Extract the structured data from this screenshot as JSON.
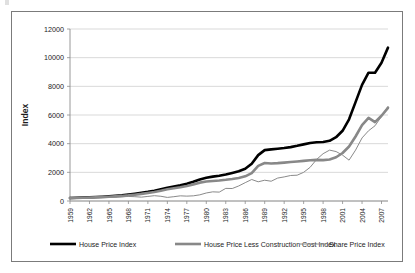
{
  "figure": {
    "background_color": "#ffffff",
    "border_color": "#7b7b7b"
  },
  "chart_data": {
    "type": "line",
    "title": "",
    "xlabel": "",
    "ylabel": "Index",
    "xlim": [
      1959,
      2008
    ],
    "ylim": [
      0,
      12000
    ],
    "grid": true,
    "grid_axis": "y",
    "legend_position": "bottom",
    "ytick_labels": [
      "0",
      "2000",
      "4000",
      "6000",
      "8000",
      "10000",
      "12000"
    ],
    "yticks": [
      0,
      2000,
      4000,
      6000,
      8000,
      10000,
      12000
    ],
    "xtick_labels": [
      "1959",
      "1962",
      "1965",
      "1968",
      "1971",
      "1974",
      "1977",
      "1980",
      "1983",
      "1986",
      "1989",
      "1992",
      "1995",
      "1998",
      "2001",
      "2004",
      "2007"
    ],
    "xticks": [
      1959,
      1962,
      1965,
      1968,
      1971,
      1974,
      1977,
      1980,
      1983,
      1986,
      1989,
      1992,
      1995,
      1998,
      2001,
      2004,
      2007
    ],
    "x": [
      1959,
      1960,
      1961,
      1962,
      1963,
      1964,
      1965,
      1966,
      1967,
      1968,
      1969,
      1970,
      1971,
      1972,
      1973,
      1974,
      1975,
      1976,
      1977,
      1978,
      1979,
      1980,
      1981,
      1982,
      1983,
      1984,
      1985,
      1986,
      1987,
      1988,
      1989,
      1990,
      1991,
      1992,
      1993,
      1994,
      1995,
      1996,
      1997,
      1998,
      1999,
      2000,
      2001,
      2002,
      2003,
      2004,
      2005,
      2006,
      2007,
      2008
    ],
    "series": [
      {
        "name": "House Price Index",
        "color": "#000000",
        "line_width": 2.6,
        "values": [
          210,
          225,
          240,
          255,
          275,
          300,
          330,
          360,
          400,
          450,
          510,
          570,
          640,
          720,
          820,
          930,
          1010,
          1090,
          1200,
          1340,
          1500,
          1620,
          1700,
          1760,
          1850,
          1960,
          2080,
          2250,
          2600,
          3200,
          3550,
          3600,
          3650,
          3700,
          3760,
          3850,
          3950,
          4050,
          4100,
          4120,
          4200,
          4450,
          4900,
          5700,
          6900,
          8100,
          8950,
          8950,
          9650,
          10700
        ]
      },
      {
        "name": "House Price Less Construction Cost Index",
        "color": "#888888",
        "line_width": 2.6,
        "values": [
          200,
          210,
          222,
          236,
          252,
          272,
          295,
          320,
          350,
          390,
          440,
          495,
          560,
          630,
          720,
          820,
          890,
          960,
          1050,
          1160,
          1280,
          1360,
          1400,
          1430,
          1480,
          1540,
          1610,
          1720,
          1950,
          2450,
          2650,
          2620,
          2640,
          2680,
          2720,
          2760,
          2800,
          2840,
          2870,
          2850,
          2900,
          3050,
          3350,
          3800,
          4500,
          5300,
          5800,
          5500,
          5950,
          6500
        ]
      },
      {
        "name": "Share Price Index",
        "color": "#8a8a8a",
        "line_width": 1.0,
        "values": [
          200,
          215,
          230,
          215,
          240,
          265,
          280,
          265,
          290,
          320,
          300,
          270,
          320,
          370,
          330,
          250,
          300,
          360,
          340,
          360,
          430,
          560,
          640,
          620,
          880,
          870,
          1050,
          1280,
          1500,
          1340,
          1450,
          1380,
          1600,
          1680,
          1780,
          1800,
          2000,
          2350,
          2900,
          3300,
          3550,
          3450,
          3200,
          2850,
          3550,
          4400,
          4900,
          5250,
          5900,
          6600
        ]
      }
    ],
    "legend_entries": [
      {
        "label": "House Price Index",
        "color": "#000000",
        "line_width": 2.6
      },
      {
        "label": "House Price Less Construction Cost Index",
        "color": "#888888",
        "line_width": 2.6
      },
      {
        "label": "Share Price Index",
        "color": "#8a8a8a",
        "line_width": 1.0
      }
    ]
  }
}
